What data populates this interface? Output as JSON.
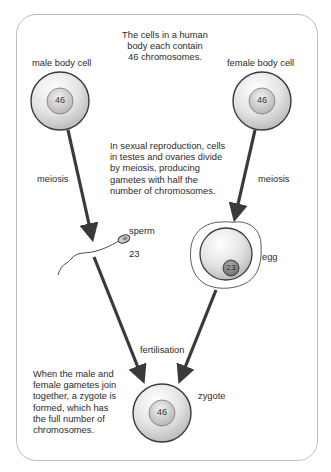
{
  "diagram": {
    "title_note": [
      "The cells in a human",
      "body each contain",
      "46 chromosomes."
    ],
    "male_cell": {
      "label": "male body cell",
      "chromosomes": "46"
    },
    "female_cell": {
      "label": "female body cell",
      "chromosomes": "46"
    },
    "meiosis_left": "meiosis",
    "meiosis_right": "meiosis",
    "meiosis_note": [
      "In sexual reproduction, cells",
      "in testes and ovaries divide",
      "by meiosis, producing",
      "gametes with half the",
      "number of chromosomes."
    ],
    "sperm": {
      "label": "sperm",
      "chromosomes": "23"
    },
    "egg": {
      "label": "egg",
      "chromosomes": "23"
    },
    "fertilisation": "fertilisation",
    "zygote": {
      "label": "zygote",
      "chromosomes": "46"
    },
    "zygote_note": [
      "When the male and",
      "female gametes join",
      "together, a zygote is",
      "formed, which has",
      "the full number of",
      "chromosomes."
    ]
  },
  "colors": {
    "frame": "#bdbdbd",
    "cell_outer": "#e6e6e6",
    "cell_border": "#3a3a3a",
    "arrow": "#3a3a3a",
    "egg_nucleus": "#8a8a8a"
  }
}
